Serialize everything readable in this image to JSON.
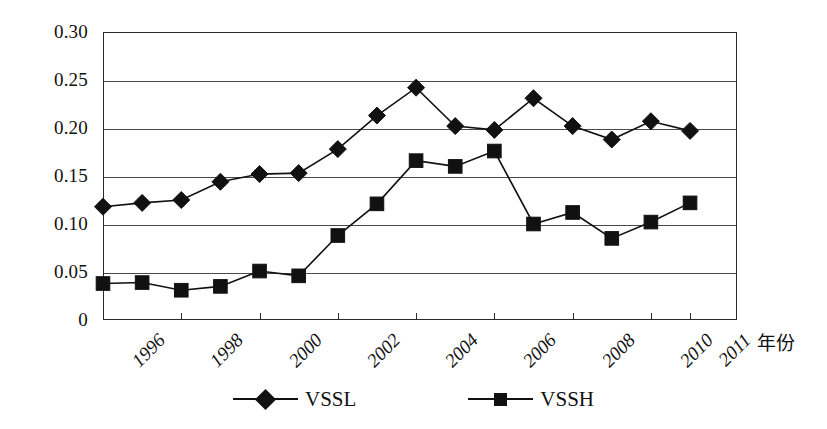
{
  "chart_data": {
    "type": "line",
    "title": "",
    "xlabel": "年份",
    "ylabel": "",
    "x": [
      1996,
      1997,
      1998,
      1999,
      2000,
      2001,
      2002,
      2003,
      2004,
      2005,
      2006,
      2007,
      2008,
      2009,
      2010,
      2011
    ],
    "xlim": [
      1996,
      2012.2
    ],
    "ylim": [
      0,
      0.3
    ],
    "grid": true,
    "legend_position": "bottom",
    "x_tick_labels": [
      "1996",
      "1998",
      "2000",
      "2002",
      "2004",
      "2006",
      "2008",
      "2010",
      "2011"
    ],
    "x_tick_values": [
      1996,
      1998,
      2000,
      2002,
      2004,
      2006,
      2008,
      2010,
      2011
    ],
    "y_tick_labels": [
      "0.30",
      "0.25",
      "0.20",
      "0.15",
      "0.10",
      "0.05",
      "0"
    ],
    "y_tick_values": [
      0.3,
      0.25,
      0.2,
      0.15,
      0.1,
      0.05,
      0
    ],
    "series": [
      {
        "name": "VSSL",
        "marker": "diamond",
        "color": "#111111",
        "values": [
          0.118,
          0.122,
          0.125,
          0.144,
          0.152,
          0.153,
          0.178,
          0.213,
          0.242,
          0.202,
          0.198,
          0.231,
          0.202,
          0.188,
          0.207,
          0.197
        ]
      },
      {
        "name": "VSSH",
        "marker": "square",
        "color": "#111111",
        "values": [
          0.038,
          0.039,
          0.031,
          0.035,
          0.051,
          0.046,
          0.088,
          0.121,
          0.166,
          0.16,
          0.176,
          0.1,
          0.112,
          0.085,
          0.102,
          0.122
        ]
      }
    ]
  },
  "legend": {
    "entries": [
      {
        "label": "VSSL",
        "marker": "diamond-marker-icon"
      },
      {
        "label": "VSSH",
        "marker": "square-marker-icon"
      }
    ]
  },
  "axis": {
    "x_title": "年份"
  }
}
